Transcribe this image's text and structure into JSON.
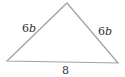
{
  "diagram": {
    "type": "triangle",
    "kind": "isosceles",
    "stroke_color": "#a0a0a0",
    "text_color": "#333333",
    "vertices": {
      "left": [
        7,
        61
      ],
      "apex": [
        67,
        3
      ],
      "right": [
        118,
        63
      ]
    },
    "sides": {
      "left": {
        "coefficient": "6",
        "variable": "b"
      },
      "right": {
        "coefficient": "6",
        "variable": "b"
      },
      "base": {
        "value": "8"
      }
    }
  }
}
